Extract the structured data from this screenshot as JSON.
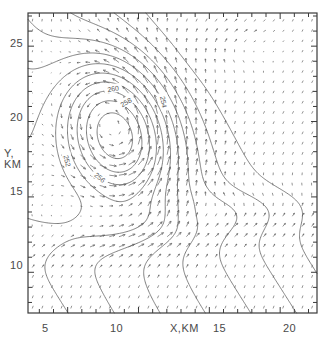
{
  "chart_data": {
    "type": "contour-vector",
    "title": "",
    "subtitle": "",
    "xlabel": "X,KM",
    "ylabel_line1": "Y,",
    "ylabel_line2": "KM",
    "xlim": [
      2.2,
      22.6
    ],
    "ylim": [
      7.3,
      27.2
    ],
    "xticks": [
      5,
      10,
      15,
      20
    ],
    "xtick_labels": [
      "5",
      "10",
      "15",
      "20"
    ],
    "yticks": [
      10,
      15,
      20,
      25
    ],
    "ytick_labels": [
      "10",
      "15",
      "20",
      "25"
    ],
    "minor_tick_interval": 1,
    "grid": false,
    "legend": "none",
    "line_color": "#555555",
    "axis_color": "#3a3a3a",
    "text_color": "#4a4a4a",
    "contour_labels": [
      {
        "text": "260",
        "x": 8.2,
        "y": 22.2,
        "rotation": -8
      },
      {
        "text": "258",
        "x": 9.1,
        "y": 21.3,
        "rotation": -30
      },
      {
        "text": "252",
        "x": 5.0,
        "y": 17.4,
        "rotation": 78
      },
      {
        "text": "256",
        "x": 7.3,
        "y": 16.3,
        "rotation": 40
      },
      {
        "text": "254",
        "x": 11.8,
        "y": 21.3,
        "rotation": 80
      }
    ],
    "contour_levels": [
      244,
      246,
      248,
      250,
      252,
      254,
      256,
      258,
      260,
      262,
      264,
      266
    ],
    "vector_field": {
      "description": "horizontal wind vectors on regular grid",
      "grid_spacing_km": 0.68,
      "max_arrow_length_px": 9
    },
    "features": [
      {
        "name": "primary vortex center",
        "x": 8.6,
        "y": 19.4
      },
      {
        "name": "secondary closed contour",
        "x": 17.3,
        "y": 24.9
      },
      {
        "name": "lower closed contour",
        "x": 13.6,
        "y": 13.7
      }
    ]
  }
}
